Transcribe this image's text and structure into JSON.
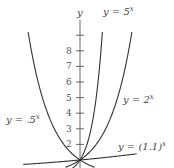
{
  "chart_data": {
    "type": "line",
    "title": "",
    "xlabel": "",
    "ylabel": "y",
    "ylim": [
      0,
      9.5
    ],
    "xlim": [
      -3.5,
      3.5
    ],
    "grid": false,
    "y_ticks": [
      2,
      3,
      4,
      5,
      6,
      7,
      8,
      9
    ],
    "y_tick_labels": [
      "2",
      "3",
      "4",
      "5",
      "6",
      "7",
      "8",
      ""
    ],
    "series": [
      {
        "name": "y = .5^x",
        "base": 0.5,
        "label": "y = .5",
        "exp": "x"
      },
      {
        "name": "y = 5^x",
        "base": 5,
        "label": "y = 5",
        "exp": "x"
      },
      {
        "name": "y = 2^x",
        "base": 2,
        "label": "y = 2",
        "exp": "x"
      },
      {
        "name": "y = (1.1)^x",
        "base": 1.1,
        "label": "y = (1.1)",
        "exp": "x"
      }
    ],
    "annotations": [
      "All curves pass through (0, 1)"
    ]
  },
  "axis": {
    "y_label": "y"
  },
  "colors": {
    "curve": "#333333",
    "axis": "#555555",
    "text": "#444444"
  }
}
